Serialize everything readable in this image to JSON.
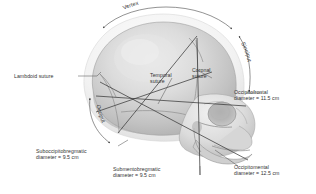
{
  "figure": {
    "kind": "fetal-skull-diameters-diagram",
    "background": "#ffffff",
    "text_color": "#333333",
    "line_color": "#3a3a3a",
    "skull_fill_light": "#e9e9e9",
    "skull_fill_mid": "#cfcfcf",
    "skull_fill_dark": "#b4b4b4",
    "scalp_fill": "#f4f4f4"
  },
  "region_labels": {
    "vertex": "Vertex",
    "sinciput": "Sinciput",
    "occiput": "Occiput"
  },
  "suture_labels": [
    {
      "id": "lambdoid",
      "line1": "Lambdoid suture",
      "line2": ""
    },
    {
      "id": "temporal",
      "line1": "Temporal",
      "line2": "suture"
    },
    {
      "id": "coronal",
      "line1": "Coronal",
      "line2": "suture"
    }
  ],
  "diameter_labels": [
    {
      "id": "occipitofrontal",
      "line1": "Occipitofrontal",
      "line2": "diameter = 11.5 cm",
      "name": "Occipitofrontal",
      "value": "11.5",
      "unit": "cm"
    },
    {
      "id": "occipitomental",
      "line1": "Occipitomental",
      "line2": "diameter = 12.5 cm",
      "name": "Occipitomental",
      "value": "12.5",
      "unit": "cm"
    },
    {
      "id": "suboccipitobregmatic",
      "line1": "Suboccipitobregmatic",
      "line2": "diameter = 9.5 cm",
      "name": "Suboccipitobregmatic",
      "value": "9.5",
      "unit": "cm"
    },
    {
      "id": "submentobregmatic",
      "line1": "Submentobregmatic",
      "line2": "diameter = 9.5 cm",
      "name": "Submentobregmatic",
      "value": "9.5",
      "unit": "cm"
    }
  ]
}
